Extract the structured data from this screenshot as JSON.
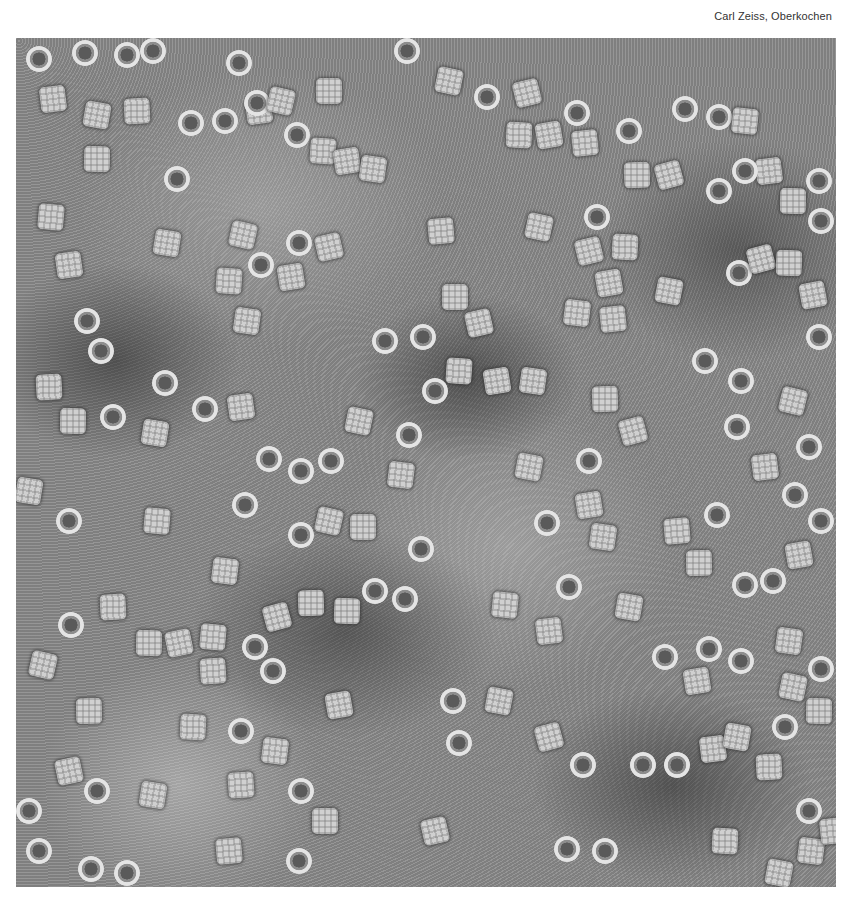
{
  "credit": "Carl Zeiss, Oberkochen",
  "image": {
    "description": "Transmission electron micrograph, negative stain, showing ring-shaped (circular end-on) and square (side-on) protein particles scattered over a grainy gray background",
    "particle_types": [
      "ring",
      "square"
    ]
  },
  "particles": [
    {
      "t": "ring",
      "x": 10,
      "y": 8
    },
    {
      "t": "ring",
      "x": 56,
      "y": 2
    },
    {
      "t": "ring",
      "x": 98,
      "y": 4
    },
    {
      "t": "ring",
      "x": 124,
      "y": 0
    },
    {
      "t": "sq",
      "x": 24,
      "y": 48
    },
    {
      "t": "sq",
      "x": 68,
      "y": 64
    },
    {
      "t": "sq",
      "x": 108,
      "y": 60
    },
    {
      "t": "ring",
      "x": 162,
      "y": 72
    },
    {
      "t": "sq",
      "x": 68,
      "y": 108
    },
    {
      "t": "ring",
      "x": 148,
      "y": 128
    },
    {
      "t": "ring",
      "x": 210,
      "y": 12
    },
    {
      "t": "sq",
      "x": 230,
      "y": 60
    },
    {
      "t": "ring",
      "x": 196,
      "y": 70
    },
    {
      "t": "ring",
      "x": 228,
      "y": 52
    },
    {
      "t": "sq",
      "x": 252,
      "y": 50
    },
    {
      "t": "sq",
      "x": 300,
      "y": 40
    },
    {
      "t": "ring",
      "x": 268,
      "y": 84
    },
    {
      "t": "sq",
      "x": 294,
      "y": 100
    },
    {
      "t": "sq",
      "x": 318,
      "y": 110
    },
    {
      "t": "sq",
      "x": 344,
      "y": 118
    },
    {
      "t": "ring",
      "x": 378,
      "y": 0
    },
    {
      "t": "sq",
      "x": 420,
      "y": 30
    },
    {
      "t": "ring",
      "x": 458,
      "y": 46
    },
    {
      "t": "sq",
      "x": 498,
      "y": 42
    },
    {
      "t": "sq",
      "x": 490,
      "y": 84
    },
    {
      "t": "sq",
      "x": 520,
      "y": 84
    },
    {
      "t": "ring",
      "x": 548,
      "y": 62
    },
    {
      "t": "sq",
      "x": 556,
      "y": 92
    },
    {
      "t": "ring",
      "x": 600,
      "y": 80
    },
    {
      "t": "sq",
      "x": 608,
      "y": 124
    },
    {
      "t": "sq",
      "x": 640,
      "y": 124
    },
    {
      "t": "ring",
      "x": 656,
      "y": 58
    },
    {
      "t": "ring",
      "x": 690,
      "y": 66
    },
    {
      "t": "sq",
      "x": 716,
      "y": 70
    },
    {
      "t": "sq",
      "x": 740,
      "y": 120
    },
    {
      "t": "ring",
      "x": 716,
      "y": 120
    },
    {
      "t": "ring",
      "x": 690,
      "y": 140
    },
    {
      "t": "ring",
      "x": 790,
      "y": 130
    },
    {
      "t": "sq",
      "x": 764,
      "y": 150
    },
    {
      "t": "ring",
      "x": 792,
      "y": 170
    },
    {
      "t": "sq",
      "x": 22,
      "y": 166
    },
    {
      "t": "sq",
      "x": 40,
      "y": 214
    },
    {
      "t": "sq",
      "x": 138,
      "y": 192
    },
    {
      "t": "ring",
      "x": 232,
      "y": 214
    },
    {
      "t": "sq",
      "x": 214,
      "y": 184
    },
    {
      "t": "ring",
      "x": 270,
      "y": 192
    },
    {
      "t": "sq",
      "x": 300,
      "y": 196
    },
    {
      "t": "sq",
      "x": 200,
      "y": 230
    },
    {
      "t": "sq",
      "x": 262,
      "y": 226
    },
    {
      "t": "sq",
      "x": 218,
      "y": 270
    },
    {
      "t": "sq",
      "x": 412,
      "y": 180
    },
    {
      "t": "sq",
      "x": 510,
      "y": 176
    },
    {
      "t": "ring",
      "x": 568,
      "y": 166
    },
    {
      "t": "sq",
      "x": 560,
      "y": 200
    },
    {
      "t": "sq",
      "x": 596,
      "y": 196
    },
    {
      "t": "sq",
      "x": 580,
      "y": 232
    },
    {
      "t": "sq",
      "x": 548,
      "y": 262
    },
    {
      "t": "sq",
      "x": 584,
      "y": 268
    },
    {
      "t": "sq",
      "x": 640,
      "y": 240
    },
    {
      "t": "ring",
      "x": 710,
      "y": 222
    },
    {
      "t": "sq",
      "x": 732,
      "y": 208
    },
    {
      "t": "sq",
      "x": 760,
      "y": 212
    },
    {
      "t": "sq",
      "x": 784,
      "y": 244
    },
    {
      "t": "ring",
      "x": 790,
      "y": 286
    },
    {
      "t": "ring",
      "x": 58,
      "y": 270
    },
    {
      "t": "ring",
      "x": 72,
      "y": 300
    },
    {
      "t": "sq",
      "x": 20,
      "y": 336
    },
    {
      "t": "ring",
      "x": 136,
      "y": 332
    },
    {
      "t": "sq",
      "x": 44,
      "y": 370
    },
    {
      "t": "ring",
      "x": 84,
      "y": 366
    },
    {
      "t": "ring",
      "x": 176,
      "y": 358
    },
    {
      "t": "sq",
      "x": 212,
      "y": 356
    },
    {
      "t": "sq",
      "x": 126,
      "y": 382
    },
    {
      "t": "ring",
      "x": 356,
      "y": 290
    },
    {
      "t": "ring",
      "x": 394,
      "y": 286
    },
    {
      "t": "sq",
      "x": 426,
      "y": 246
    },
    {
      "t": "sq",
      "x": 450,
      "y": 272
    },
    {
      "t": "sq",
      "x": 430,
      "y": 320
    },
    {
      "t": "sq",
      "x": 468,
      "y": 330
    },
    {
      "t": "sq",
      "x": 504,
      "y": 330
    },
    {
      "t": "ring",
      "x": 406,
      "y": 340
    },
    {
      "t": "sq",
      "x": 330,
      "y": 370
    },
    {
      "t": "ring",
      "x": 380,
      "y": 384
    },
    {
      "t": "ring",
      "x": 240,
      "y": 408
    },
    {
      "t": "ring",
      "x": 272,
      "y": 420
    },
    {
      "t": "ring",
      "x": 302,
      "y": 410
    },
    {
      "t": "sq",
      "x": 372,
      "y": 424
    },
    {
      "t": "ring",
      "x": 560,
      "y": 410
    },
    {
      "t": "sq",
      "x": 500,
      "y": 416
    },
    {
      "t": "sq",
      "x": 576,
      "y": 348
    },
    {
      "t": "sq",
      "x": 604,
      "y": 380
    },
    {
      "t": "ring",
      "x": 676,
      "y": 310
    },
    {
      "t": "ring",
      "x": 712,
      "y": 330
    },
    {
      "t": "ring",
      "x": 708,
      "y": 376
    },
    {
      "t": "sq",
      "x": 736,
      "y": 416
    },
    {
      "t": "ring",
      "x": 766,
      "y": 444
    },
    {
      "t": "ring",
      "x": 780,
      "y": 396
    },
    {
      "t": "sq",
      "x": 764,
      "y": 350
    },
    {
      "t": "ring",
      "x": 792,
      "y": 470
    },
    {
      "t": "ring",
      "x": 216,
      "y": 454
    },
    {
      "t": "sq",
      "x": 128,
      "y": 470
    },
    {
      "t": "ring",
      "x": 40,
      "y": 470
    },
    {
      "t": "sq",
      "x": 0,
      "y": 440
    },
    {
      "t": "ring",
      "x": 272,
      "y": 484
    },
    {
      "t": "sq",
      "x": 300,
      "y": 470
    },
    {
      "t": "sq",
      "x": 334,
      "y": 476
    },
    {
      "t": "ring",
      "x": 392,
      "y": 498
    },
    {
      "t": "ring",
      "x": 518,
      "y": 472
    },
    {
      "t": "sq",
      "x": 560,
      "y": 454
    },
    {
      "t": "sq",
      "x": 574,
      "y": 486
    },
    {
      "t": "sq",
      "x": 648,
      "y": 480
    },
    {
      "t": "ring",
      "x": 688,
      "y": 464
    },
    {
      "t": "sq",
      "x": 670,
      "y": 512
    },
    {
      "t": "ring",
      "x": 716,
      "y": 534
    },
    {
      "t": "ring",
      "x": 744,
      "y": 530
    },
    {
      "t": "sq",
      "x": 770,
      "y": 504
    },
    {
      "t": "sq",
      "x": 196,
      "y": 520
    },
    {
      "t": "ring",
      "x": 346,
      "y": 540
    },
    {
      "t": "ring",
      "x": 376,
      "y": 548
    },
    {
      "t": "sq",
      "x": 282,
      "y": 552
    },
    {
      "t": "sq",
      "x": 248,
      "y": 566
    },
    {
      "t": "sq",
      "x": 318,
      "y": 560
    },
    {
      "t": "ring",
      "x": 540,
      "y": 536
    },
    {
      "t": "sq",
      "x": 476,
      "y": 554
    },
    {
      "t": "sq",
      "x": 520,
      "y": 580
    },
    {
      "t": "sq",
      "x": 600,
      "y": 556
    },
    {
      "t": "sq",
      "x": 84,
      "y": 556
    },
    {
      "t": "ring",
      "x": 42,
      "y": 574
    },
    {
      "t": "sq",
      "x": 120,
      "y": 592
    },
    {
      "t": "sq",
      "x": 150,
      "y": 592
    },
    {
      "t": "sq",
      "x": 184,
      "y": 586
    },
    {
      "t": "ring",
      "x": 226,
      "y": 596
    },
    {
      "t": "ring",
      "x": 244,
      "y": 620
    },
    {
      "t": "sq",
      "x": 184,
      "y": 620
    },
    {
      "t": "sq",
      "x": 14,
      "y": 614
    },
    {
      "t": "ring",
      "x": 636,
      "y": 606
    },
    {
      "t": "ring",
      "x": 680,
      "y": 598
    },
    {
      "t": "ring",
      "x": 712,
      "y": 610
    },
    {
      "t": "sq",
      "x": 668,
      "y": 630
    },
    {
      "t": "sq",
      "x": 760,
      "y": 590
    },
    {
      "t": "ring",
      "x": 792,
      "y": 618
    },
    {
      "t": "sq",
      "x": 764,
      "y": 636
    },
    {
      "t": "sq",
      "x": 60,
      "y": 660
    },
    {
      "t": "ring",
      "x": 212,
      "y": 680
    },
    {
      "t": "sq",
      "x": 164,
      "y": 676
    },
    {
      "t": "sq",
      "x": 310,
      "y": 654
    },
    {
      "t": "sq",
      "x": 246,
      "y": 700
    },
    {
      "t": "ring",
      "x": 424,
      "y": 650
    },
    {
      "t": "sq",
      "x": 470,
      "y": 650
    },
    {
      "t": "ring",
      "x": 430,
      "y": 692
    },
    {
      "t": "sq",
      "x": 520,
      "y": 686
    },
    {
      "t": "ring",
      "x": 554,
      "y": 714
    },
    {
      "t": "ring",
      "x": 614,
      "y": 714
    },
    {
      "t": "ring",
      "x": 648,
      "y": 714
    },
    {
      "t": "sq",
      "x": 684,
      "y": 698
    },
    {
      "t": "sq",
      "x": 708,
      "y": 686
    },
    {
      "t": "sq",
      "x": 740,
      "y": 716
    },
    {
      "t": "ring",
      "x": 756,
      "y": 676
    },
    {
      "t": "sq",
      "x": 790,
      "y": 660
    },
    {
      "t": "sq",
      "x": 40,
      "y": 720
    },
    {
      "t": "ring",
      "x": 68,
      "y": 740
    },
    {
      "t": "ring",
      "x": 0,
      "y": 760
    },
    {
      "t": "sq",
      "x": 124,
      "y": 744
    },
    {
      "t": "sq",
      "x": 212,
      "y": 734
    },
    {
      "t": "ring",
      "x": 272,
      "y": 740
    },
    {
      "t": "sq",
      "x": 296,
      "y": 770
    },
    {
      "t": "sq",
      "x": 406,
      "y": 780
    },
    {
      "t": "ring",
      "x": 10,
      "y": 800
    },
    {
      "t": "ring",
      "x": 62,
      "y": 818
    },
    {
      "t": "ring",
      "x": 98,
      "y": 822
    },
    {
      "t": "sq",
      "x": 200,
      "y": 800
    },
    {
      "t": "ring",
      "x": 270,
      "y": 810
    },
    {
      "t": "ring",
      "x": 538,
      "y": 798
    },
    {
      "t": "ring",
      "x": 576,
      "y": 800
    },
    {
      "t": "sq",
      "x": 696,
      "y": 790
    },
    {
      "t": "ring",
      "x": 780,
      "y": 760
    },
    {
      "t": "sq",
      "x": 782,
      "y": 800
    },
    {
      "t": "sq",
      "x": 804,
      "y": 780
    },
    {
      "t": "sq",
      "x": 750,
      "y": 822
    }
  ]
}
